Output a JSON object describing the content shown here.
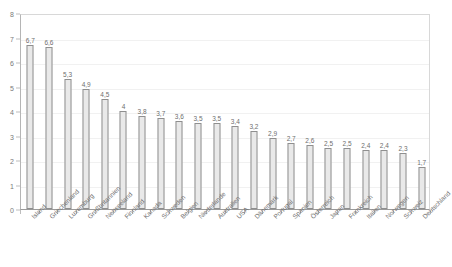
{
  "chart_data": {
    "type": "bar",
    "title": "",
    "subtitle": "",
    "xlabel": "",
    "ylabel": "",
    "ylim": [
      0,
      8
    ],
    "ytick_step": 1,
    "yticks": [
      "0",
      "1",
      "2",
      "3",
      "4",
      "5",
      "6",
      "7",
      "8"
    ],
    "grid": true,
    "grid_axis": "y",
    "legend": false,
    "legend_position": "none",
    "bar_fill_color": "#e9e9e9",
    "bar_border_color": "#8f8f8f",
    "value_labels_shown": true,
    "categories": [
      "Island",
      "Griechenland",
      "Luxemburg",
      "Großbritannien",
      "Neuseeland",
      "Finnland",
      "Kanada",
      "Schweden",
      "Belgien",
      "Niederlande",
      "Australien",
      "USA",
      "Dänemark",
      "Portugal",
      "Spanien",
      "Österreich",
      "Japan",
      "Frankreich",
      "Italien",
      "Norwegen",
      "Schweiz",
      "Deutschland"
    ],
    "values": [
      6.7,
      6.6,
      5.3,
      4.9,
      4.5,
      4,
      3.8,
      3.7,
      3.6,
      3.5,
      3.5,
      3.4,
      3.2,
      2.9,
      2.7,
      2.6,
      2.5,
      2.5,
      2.4,
      2.4,
      2.3,
      1.7
    ],
    "value_labels": [
      "6,7",
      "6,6",
      "5,3",
      "4,9",
      "4,5",
      "4",
      "3,8",
      "3,7",
      "3,6",
      "3,5",
      "3,5",
      "3,4",
      "3,2",
      "2,9",
      "2,7",
      "2,6",
      "2,5",
      "2,5",
      "2,4",
      "2,4",
      "2,3",
      "1,7"
    ]
  }
}
